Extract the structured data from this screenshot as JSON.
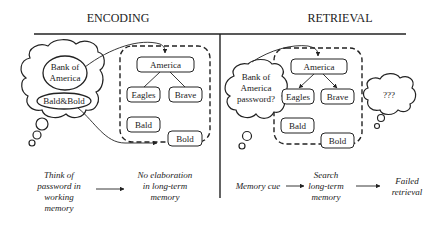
{
  "panels": {
    "encoding": {
      "title": "ENCODING",
      "thought_cloud": {
        "item1_line1": "Bank of",
        "item1_line2": "America",
        "item2": "Bald&Bold"
      },
      "memory_nodes": {
        "root": "America",
        "child_left": "Eagles",
        "child_right": "Brave",
        "orphan1": "Bald",
        "orphan2": "Bold"
      },
      "captions": {
        "left": [
          "Think of",
          "password in",
          "working",
          "memory"
        ],
        "right": [
          "No elaboration",
          "in long-term",
          "memory"
        ]
      }
    },
    "retrieval": {
      "title": "RETRIEVAL",
      "thought_cloud": {
        "line1": "Bank of",
        "line2": "America",
        "line3": "password?"
      },
      "memory_nodes": {
        "root": "America",
        "child_left": "Eagles",
        "child_right": "Brave",
        "orphan1": "Bald",
        "orphan2": "Bold"
      },
      "result_cloud": "???",
      "captions": {
        "step1": [
          "Memory cue"
        ],
        "step2": [
          "Search",
          "long-term",
          "memory"
        ],
        "step3": [
          "Failed",
          "retrieval"
        ]
      }
    }
  },
  "colors": {
    "stroke": "#222222",
    "background": "#ffffff"
  }
}
